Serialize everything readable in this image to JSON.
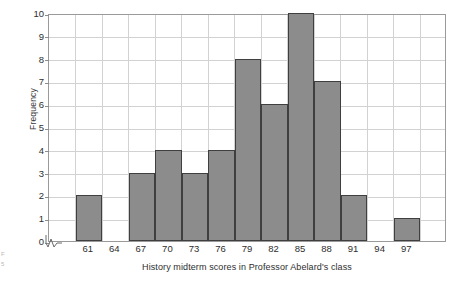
{
  "chart_data": {
    "type": "bar",
    "title": "",
    "xlabel": "History midterm scores in Professor Abelard's class",
    "ylabel": "Frequency",
    "categories": [
      "61",
      "64",
      "67",
      "70",
      "73",
      "76",
      "79",
      "82",
      "85",
      "88",
      "91",
      "94",
      "97"
    ],
    "values": [
      2,
      0,
      3,
      4,
      3,
      4,
      8,
      6,
      10,
      7,
      2,
      0,
      1
    ],
    "xticklabels": [
      "61",
      "64",
      "67",
      "70",
      "73",
      "76",
      "79",
      "82",
      "85",
      "88",
      "91",
      "94",
      "97"
    ],
    "yticklabels": [
      "0",
      "1",
      "2",
      "3",
      "4",
      "5",
      "6",
      "7",
      "8",
      "9",
      "10"
    ],
    "yticks": [
      0,
      1,
      2,
      3,
      4,
      5,
      6,
      7,
      8,
      9,
      10
    ],
    "ylim": [
      0,
      10
    ],
    "grid": true,
    "legend": null,
    "bar_fill_color": "#8c8c8c",
    "bar_edge_color": "#3f3f3f",
    "grid_color": "#d2d2d2",
    "axis_color": "#9a9a9a",
    "axis_break": true,
    "bin_width": 3,
    "leading_empty_columns": 1,
    "trailing_empty_columns": 1
  },
  "figure": {
    "axis_break_icon": "axis-break-zigzag",
    "edge_marks": [
      "F",
      "5"
    ]
  }
}
